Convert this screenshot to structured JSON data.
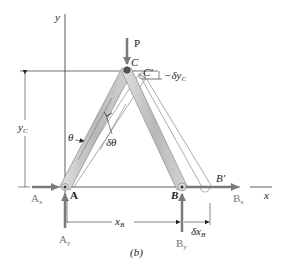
{
  "figure": {
    "caption": "(b)",
    "axes": {
      "x_label": "x",
      "y_label": "y"
    },
    "points": {
      "A": "A",
      "B": "B",
      "C": "C",
      "C_prime": "C'",
      "B_prime": "B'"
    },
    "forces": {
      "P": "P",
      "Ax": "A",
      "Ax_sub": "x",
      "Ay": "A",
      "Ay_sub": "y",
      "Bx": "B",
      "Bx_sub": "x",
      "By": "B",
      "By_sub": "y"
    },
    "dimensions": {
      "yC": "y",
      "yC_sub": "C",
      "xB": "x",
      "xB_sub": "B",
      "dxB": "δx",
      "dxB_sub": "B",
      "dyC": "−δy",
      "dyC_sub": "C"
    },
    "angles": {
      "theta": "θ",
      "dtheta": "δθ"
    },
    "colors": {
      "member_fill": "#c8c8c8",
      "member_stroke": "#8a8a8a",
      "force_arrow": "#7a7a7a",
      "line": "#333333"
    }
  }
}
